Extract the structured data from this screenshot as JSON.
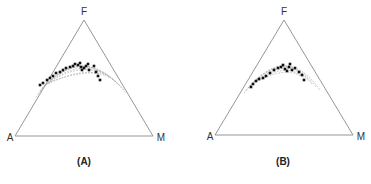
{
  "figure": {
    "panels": [
      {
        "id": "A",
        "caption": "(A)",
        "vertices": {
          "top": "F",
          "left": "A",
          "right": "M"
        }
      },
      {
        "id": "B",
        "caption": "(B)",
        "vertices": {
          "top": "F",
          "left": "A",
          "right": "M"
        }
      }
    ]
  },
  "chart_data": [
    {
      "type": "scatter",
      "subtype": "ternary",
      "title": "(A)",
      "axes": [
        "A",
        "F",
        "M"
      ],
      "description": "AFM ternary diagram with dashed calc-alkaline trend field; black points cluster along curved band near the F apex side",
      "points_svg": [
        [
          40,
          85
        ],
        [
          43,
          83
        ],
        [
          47,
          80
        ],
        [
          50,
          78
        ],
        [
          53,
          76
        ],
        [
          56,
          73
        ],
        [
          60,
          72
        ],
        [
          63,
          70
        ],
        [
          66,
          68
        ],
        [
          70,
          67
        ],
        [
          73,
          66
        ],
        [
          75,
          64
        ],
        [
          78,
          65
        ],
        [
          80,
          63
        ],
        [
          81,
          67
        ],
        [
          82,
          70
        ],
        [
          84,
          68
        ],
        [
          86,
          66
        ],
        [
          88,
          64
        ],
        [
          89,
          70
        ],
        [
          94,
          66
        ],
        [
          96,
          72
        ],
        [
          98,
          76
        ],
        [
          100,
          80
        ]
      ],
      "grid": false
    },
    {
      "type": "scatter",
      "subtype": "ternary",
      "title": "(B)",
      "axes": [
        "A",
        "F",
        "M"
      ],
      "description": "AFM ternary diagram with dashed trend field; black points cluster along curved band",
      "points_svg": [
        [
          251,
          87
        ],
        [
          253,
          84
        ],
        [
          256,
          81
        ],
        [
          259,
          79
        ],
        [
          263,
          78
        ],
        [
          266,
          76
        ],
        [
          270,
          73
        ],
        [
          274,
          70
        ],
        [
          278,
          68
        ],
        [
          281,
          67
        ],
        [
          283,
          65
        ],
        [
          285,
          69
        ],
        [
          287,
          71
        ],
        [
          289,
          67
        ],
        [
          290,
          64
        ],
        [
          292,
          70
        ],
        [
          295,
          68
        ],
        [
          299,
          72
        ],
        [
          302,
          75
        ],
        [
          304,
          80
        ]
      ],
      "grid": false
    }
  ]
}
